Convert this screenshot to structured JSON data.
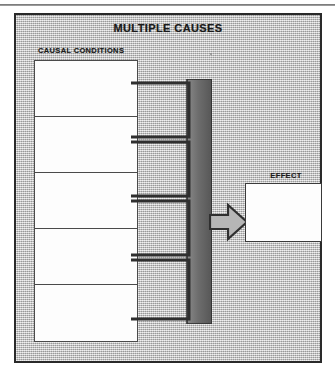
{
  "diagram": {
    "title": "MULTIPLE CAUSES",
    "causal_label": "CAUSAL CONDITIONS",
    "effect_label": "EFFECT",
    "condition_count": 5,
    "conditions": [
      {
        "index": 1,
        "text": ""
      },
      {
        "index": 2,
        "text": ""
      },
      {
        "index": 3,
        "text": ""
      },
      {
        "index": 4,
        "text": ""
      },
      {
        "index": 5,
        "text": ""
      }
    ],
    "effect": {
      "text": ""
    },
    "connector": {
      "type": "comb-bracket",
      "prong_count": 4,
      "direction": "left-to-right"
    },
    "arrow": {
      "type": "block-arrow",
      "direction": "right",
      "from": "CAUSAL CONDITIONS",
      "to": "EFFECT"
    },
    "colors": {
      "panel_background": "#c2c2c2",
      "panel_border": "#2a2a2a",
      "box_fill": "#fdfdfd",
      "box_border": "#4a4a4a",
      "bracket_dark": "#6e6e6e",
      "bracket_outline": "#2f2f2f",
      "arrow_fill": "#b6b6b6",
      "arrow_outline": "#2f2f2f",
      "text": "#1a1a1a"
    }
  }
}
